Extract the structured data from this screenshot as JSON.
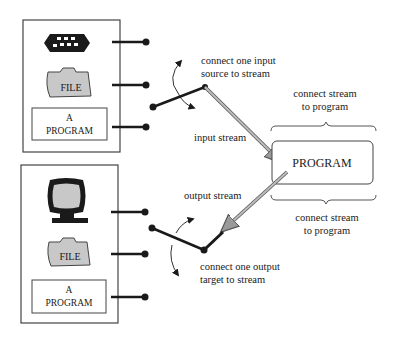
{
  "diagram": {
    "input_sources": {
      "items": [
        {
          "id": "keyboard",
          "icon": "keyboard-icon"
        },
        {
          "id": "file",
          "icon": "folder-icon",
          "label": "FILE"
        },
        {
          "id": "program",
          "label_line1": "A",
          "label_line2": "PROGRAM"
        }
      ]
    },
    "output_targets": {
      "items": [
        {
          "id": "monitor",
          "icon": "monitor-icon"
        },
        {
          "id": "file",
          "icon": "folder-icon",
          "label": "FILE"
        },
        {
          "id": "program",
          "label_line1": "A",
          "label_line2": "PROGRAM"
        }
      ]
    },
    "program": {
      "label": "PROGRAM"
    },
    "labels": {
      "connect_input_line1": "connect one input",
      "connect_input_line2": "source to stream",
      "input_stream": "input stream",
      "output_stream": "output stream",
      "connect_output_line1": "connect one output",
      "connect_output_line2": "target to stream",
      "connect_stream_top_line1": "connect stream",
      "connect_stream_top_line2": "to program",
      "connect_stream_bottom_line1": "connect stream",
      "connect_stream_bottom_line2": "to program"
    },
    "colors": {
      "line": "#1a1a1a",
      "icon_fill": "#c8c8c8",
      "stream_arrow": "#a8a8a8"
    }
  }
}
